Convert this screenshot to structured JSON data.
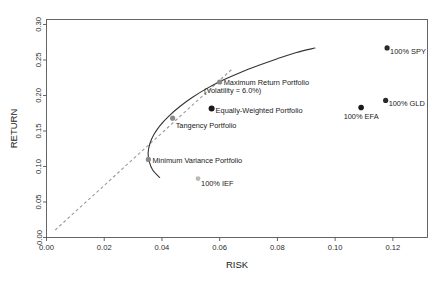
{
  "figure": {
    "background": "#ffffff",
    "frame_color": "#555555",
    "caption_partial": "",
    "header_partial": ""
  },
  "chart_data": {
    "type": "scatter",
    "title": "",
    "xlabel": "RISK",
    "ylabel": "RETURN",
    "xlim": [
      0.0,
      0.132
    ],
    "ylim": [
      0.0,
      0.307
    ],
    "xticks": [
      "0.00",
      "0.02",
      "0.04",
      "0.06",
      "0.08",
      "0.10",
      "0.12"
    ],
    "xtick_values": [
      0.0,
      0.02,
      0.04,
      0.06,
      0.08,
      0.1,
      0.12
    ],
    "yticks": [
      "0.00",
      "0.05",
      "0.10",
      "0.15",
      "0.20",
      "0.25",
      "0.30"
    ],
    "ytick_values": [
      0.0,
      0.05,
      0.1,
      0.15,
      0.2,
      0.25,
      0.3
    ],
    "grid": false,
    "legend": "none",
    "points": [
      {
        "name": "100% SPY",
        "x": 0.118,
        "y": 0.267,
        "color": "#2b2b2b",
        "radius": 2.6,
        "label": "100% SPY",
        "label_dx": 3,
        "label_dy": 6,
        "label_anchor": "start"
      },
      {
        "name": "100% GLD",
        "x": 0.1175,
        "y": 0.193,
        "color": "#2b2b2b",
        "radius": 2.6,
        "label": "100% GLD",
        "label_dx": 3,
        "label_dy": 6,
        "label_anchor": "start"
      },
      {
        "name": "100% EFA",
        "x": 0.109,
        "y": 0.183,
        "color": "#1a1a1a",
        "radius": 2.8,
        "label": "100% EFA",
        "label_dx": 0,
        "label_dy": 11,
        "label_anchor": "middle"
      },
      {
        "name": "100% IEF",
        "x": 0.0525,
        "y": 0.083,
        "color": "#b9b9b9",
        "radius": 2.4,
        "label": "100% IEF",
        "label_dx": 3,
        "label_dy": 7,
        "label_anchor": "start"
      },
      {
        "name": "Equally-Weighted Portfolio",
        "x": 0.0572,
        "y": 0.1815,
        "color": "#1a1a1a",
        "radius": 3.0,
        "label": "Equally-Weighted Portfolio",
        "label_dx": 4,
        "label_dy": 4,
        "label_anchor": "start"
      },
      {
        "name": "Maximum Return Portfolio",
        "x": 0.06,
        "y": 0.219,
        "color": "#8a8a8a",
        "radius": 2.6,
        "label": "Maximum Return Portfolio",
        "label_dx": 4,
        "label_dy": 3,
        "label_anchor": "start"
      },
      {
        "name": "Tangency Portfolio",
        "x": 0.0437,
        "y": 0.168,
        "color": "#8a8a8a",
        "radius": 2.6,
        "label": "Tangency Portfolio",
        "label_dx": 3,
        "label_dy": 10,
        "label_anchor": "start"
      },
      {
        "name": "Minimum Variance Portfolio",
        "x": 0.0353,
        "y": 0.11,
        "color": "#8a8a8a",
        "radius": 2.6,
        "label": "Minimum Variance Portfolio",
        "label_dx": 4,
        "label_dy": 4,
        "label_anchor": "start"
      }
    ],
    "annotations": [
      {
        "name": "max-return-volatility-note",
        "text": "(Volatility = 6.0%)",
        "x": 0.0645,
        "y": 0.2035
      }
    ],
    "efficient_frontier": {
      "name": "efficient-frontier-curve",
      "color": "#333333",
      "style": "solid",
      "width": 1.1,
      "points": [
        [
          0.0392,
          0.0845
        ],
        [
          0.0368,
          0.095
        ],
        [
          0.0356,
          0.107
        ],
        [
          0.0352,
          0.119
        ],
        [
          0.0358,
          0.132
        ],
        [
          0.0372,
          0.145
        ],
        [
          0.0394,
          0.158
        ],
        [
          0.0424,
          0.171
        ],
        [
          0.0462,
          0.1845
        ],
        [
          0.0506,
          0.1975
        ],
        [
          0.0556,
          0.21
        ],
        [
          0.0612,
          0.2218
        ],
        [
          0.0672,
          0.2325
        ],
        [
          0.0736,
          0.2425
        ],
        [
          0.08,
          0.2518
        ],
        [
          0.0866,
          0.2605
        ],
        [
          0.093,
          0.2668
        ]
      ]
    },
    "capital_market_line": {
      "name": "capital-market-line",
      "color": "#9a9a9a",
      "style": "dashed",
      "width": 1.1,
      "points": [
        [
          0.003,
          0.0105
        ],
        [
          0.0645,
          0.238
        ]
      ]
    }
  }
}
